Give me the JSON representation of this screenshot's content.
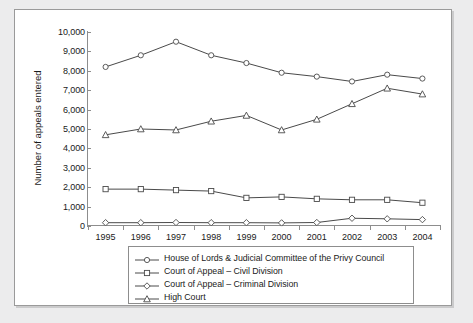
{
  "chart_data": {
    "type": "line",
    "title": "",
    "xlabel": "",
    "ylabel": "Number of appeals entered",
    "categories": [
      "1995",
      "1996",
      "1997",
      "1998",
      "1999",
      "2000",
      "2001",
      "2002",
      "2003",
      "2004"
    ],
    "xlim": [
      1995,
      2004
    ],
    "ylim": [
      0,
      10000
    ],
    "ytick_labels": [
      "10,000",
      "9,000",
      "8,000",
      "7,000",
      "6,000",
      "5,000",
      "4,000",
      "3,000",
      "2,000",
      "1,000",
      "0"
    ],
    "ytick_values": [
      10000,
      9000,
      8000,
      7000,
      6000,
      5000,
      4000,
      3000,
      2000,
      1000,
      0
    ],
    "grid": false,
    "legend_position": "bottom",
    "series": [
      {
        "name": "House of Lords & Judicial Committee of the Privy Council",
        "marker": "circle",
        "color": "#4a4a4a",
        "values": [
          8200,
          8800,
          9500,
          8800,
          8400,
          7900,
          7700,
          7450,
          7800,
          7600
        ]
      },
      {
        "name": "Court of Appeal – Civil Division",
        "marker": "square",
        "color": "#4a4a4a",
        "values": [
          1900,
          1900,
          1850,
          1800,
          1450,
          1500,
          1400,
          1350,
          1350,
          1200
        ]
      },
      {
        "name": "Court of Appeal – Criminal Division",
        "marker": "diamond",
        "color": "#4a4a4a",
        "values": [
          170,
          170,
          180,
          170,
          170,
          160,
          180,
          400,
          370,
          330
        ]
      },
      {
        "name": "High Court",
        "marker": "triangle",
        "color": "#4a4a4a",
        "values": [
          4700,
          5000,
          4950,
          5400,
          5700,
          4950,
          5500,
          6300,
          7100,
          6800
        ]
      }
    ]
  },
  "legend": {
    "items": [
      {
        "label": "House of Lords & Judicial Committee of the Privy Council",
        "marker": "circle"
      },
      {
        "label": "Court of Appeal – Civil Division",
        "marker": "square"
      },
      {
        "label": "Court of Appeal – Criminal Division",
        "marker": "diamond"
      },
      {
        "label": "High Court",
        "marker": "triangle"
      }
    ]
  },
  "axis": {
    "y_title": "Number of appeals entered"
  },
  "colors": {
    "line": "#4a4a4a",
    "axis": "#8d8d8d",
    "text": "#1a1a1a",
    "page_background": "#ececed",
    "panel_background": "#ffffff"
  }
}
